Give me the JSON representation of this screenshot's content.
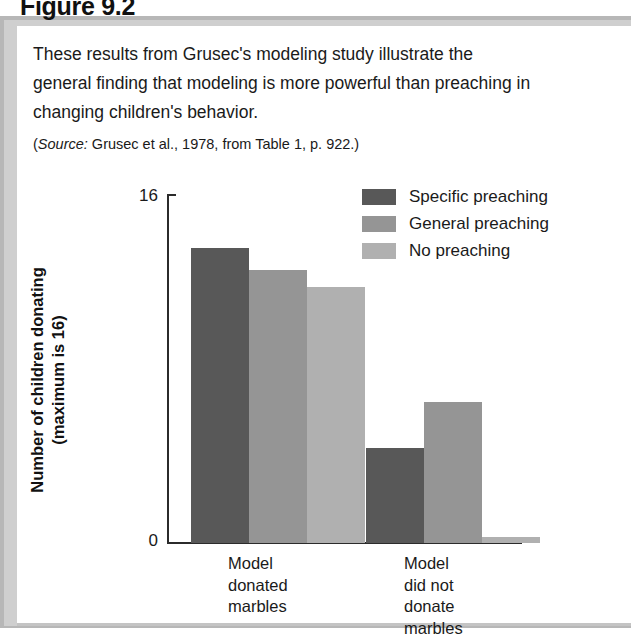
{
  "figure": {
    "number_label": "Figure 9.2",
    "caption_lines": [
      "These results from Grusec's modeling study illustrate the",
      "general finding that modeling is more powerful than preaching in",
      "changing children's behavior."
    ],
    "source_prefix": "Source:",
    "source_rest": " Grusec et al., 1978, from Table 1, p. 922.)",
    "source_open_paren": "("
  },
  "chart_data": {
    "type": "bar",
    "title": "",
    "xlabel": "",
    "ylabel": "Number of children donating (maximum is 16)",
    "ylabel_lines": [
      "Number of children donating",
      "(maximum is 16)"
    ],
    "ylim": [
      0,
      16
    ],
    "ytick_labels": [
      "16",
      "0"
    ],
    "ytick_values": [
      16,
      0
    ],
    "grid": false,
    "legend_position": "top-right",
    "categories": [
      "Model donated marbles",
      "Model did not donate marbles"
    ],
    "category_label_lines": [
      [
        "Model",
        "donated",
        "marbles"
      ],
      [
        "Model",
        "did not",
        "donate",
        "marbles"
      ]
    ],
    "series": [
      {
        "name": "Specific preaching",
        "color": "#585858",
        "values": [
          13.6,
          4.4
        ]
      },
      {
        "name": "General preaching",
        "color": "#959595",
        "values": [
          12.6,
          6.5
        ]
      },
      {
        "name": "No preaching",
        "color": "#b0b0b0",
        "values": [
          11.8,
          0.3
        ]
      }
    ]
  },
  "legend": {
    "items": [
      {
        "label": "Specific preaching",
        "color": "#585858"
      },
      {
        "label": "General preaching",
        "color": "#959595"
      },
      {
        "label": "No preaching",
        "color": "#b0b0b0"
      }
    ]
  },
  "colors": {
    "frame_gray": "#c4c4c4",
    "axis": "#2b2b2b",
    "text": "#1a1a1a",
    "page_background": "#ffffff"
  }
}
